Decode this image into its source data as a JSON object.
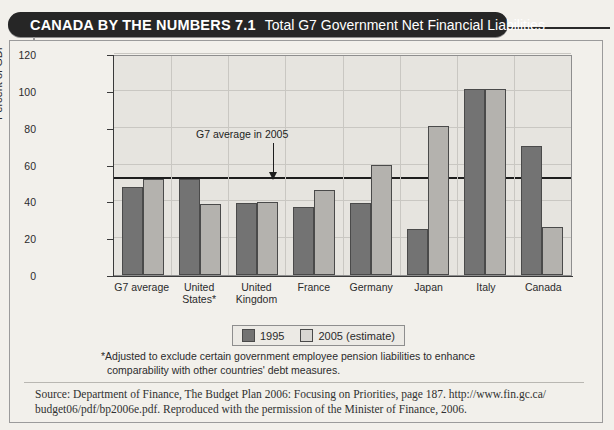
{
  "header": {
    "kicker": "CANADA BY THE NUMBERS 7.1",
    "subtitle": "Total G7 Government Net Financial Liabilities"
  },
  "chart_data": {
    "type": "bar",
    "title": "Total G7 Government Net Financial Liabilities",
    "xlabel": "",
    "ylabel": "Percent of GDP",
    "ylim": [
      0,
      120
    ],
    "yticks": [
      0,
      20,
      40,
      60,
      80,
      100,
      120
    ],
    "grid": true,
    "legend_position": "bottom",
    "categories": [
      "G7 average",
      "United States*",
      "United Kingdom",
      "France",
      "Germany",
      "Japan",
      "Italy",
      "Canada"
    ],
    "series": [
      {
        "name": "1995",
        "color": "#737373",
        "values": [
          48,
          52,
          39,
          37,
          39,
          25,
          101,
          70
        ]
      },
      {
        "name": "2005 (estimate)",
        "color": "#b4b2ae",
        "values": [
          52,
          38.5,
          39.5,
          46,
          60,
          81,
          101,
          26
        ]
      }
    ],
    "annotations": [
      {
        "label": "G7 average in 2005",
        "value": 52,
        "type": "hline-arrow"
      }
    ]
  },
  "legend": {
    "items": [
      {
        "label": "1995"
      },
      {
        "label": "2005 (estimate)"
      }
    ]
  },
  "footnote": {
    "line1": "*Adjusted to exclude certain government employee pension liabilities to enhance",
    "line2": "comparability with other countries' debt measures."
  },
  "source": {
    "line1": "Source: Department of Finance, The Budget Plan 2006: Focusing on Priorities, page 187. http://www.fin.gc.ca/",
    "line2": "budget06/pdf/bp2006e.pdf. Reproduced with the permission of the Minister of Finance, 2006."
  }
}
